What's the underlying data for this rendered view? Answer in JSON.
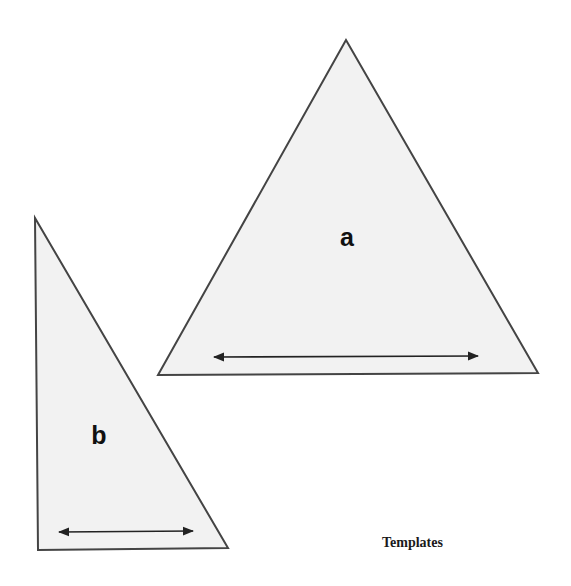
{
  "figure": {
    "caption": "Templates",
    "colors": {
      "fill": "#f2f2f2",
      "stroke": "#444444",
      "arrow": "#222222",
      "text": "#111111"
    },
    "shapes": [
      {
        "id": "a",
        "label": "a",
        "type": "isosceles-triangle",
        "points": [
          [
            346,
            40
          ],
          [
            158,
            375
          ],
          [
            538,
            373
          ]
        ],
        "label_pos": [
          347,
          246
        ],
        "arrow": {
          "from": [
            212,
            357
          ],
          "to": [
            480,
            356
          ],
          "type": "double-headed"
        }
      },
      {
        "id": "b",
        "label": "b",
        "type": "right-triangle",
        "points": [
          [
            35,
            218
          ],
          [
            38,
            550
          ],
          [
            228,
            548
          ]
        ],
        "label_pos": [
          99,
          444
        ],
        "arrow": {
          "from": [
            57,
            532
          ],
          "to": [
            195,
            531
          ],
          "type": "double-headed"
        }
      }
    ]
  }
}
